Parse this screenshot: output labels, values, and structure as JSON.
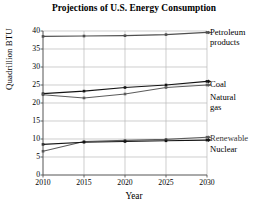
{
  "chart_data": {
    "type": "line",
    "title": "Projections of U.S. Energy Consumption",
    "xlabel": "Year",
    "ylabel": "Quadrillion BTU",
    "x": [
      2010,
      2015,
      2020,
      2025,
      2030
    ],
    "xtick_labels": [
      "2010",
      "2015",
      "2020",
      "2025",
      "2030"
    ],
    "ytick_labels": [
      "0",
      "5",
      "10",
      "15",
      "20",
      "25",
      "30",
      "35",
      "40"
    ],
    "ytick_values": [
      0,
      5,
      10,
      15,
      20,
      25,
      30,
      35,
      40
    ],
    "xlim": [
      2010,
      2030
    ],
    "ylim": [
      0,
      40
    ],
    "grid": true,
    "legend_position": "right-inline",
    "series": [
      {
        "name": "Petroleum products",
        "label_lines": [
          "Petroleum",
          "products"
        ],
        "color": "#4f4f4f",
        "values": [
          38.5,
          38.6,
          38.7,
          39.0,
          39.6
        ]
      },
      {
        "name": "Coal",
        "label_lines": [
          "Coal"
        ],
        "color": "#141414",
        "values": [
          22.6,
          23.3,
          24.3,
          25.0,
          26.0
        ]
      },
      {
        "name": "Natural gas",
        "label_lines": [
          "Natural",
          "gas"
        ],
        "color": "#5c5c5c",
        "values": [
          22.3,
          21.4,
          22.5,
          24.3,
          25.0
        ]
      },
      {
        "name": "Renewable",
        "label_lines": [
          "Renewable"
        ],
        "color": "#5c5c5c",
        "values": [
          6.6,
          9.3,
          9.6,
          9.9,
          10.5
        ]
      },
      {
        "name": "Nuclear",
        "label_lines": [
          "Nuclear"
        ],
        "color": "#141414",
        "values": [
          8.5,
          9.1,
          9.3,
          9.5,
          9.7
        ]
      }
    ]
  },
  "axis": {
    "title": "Projections of U.S. Energy Consumption",
    "xlabel": "Year",
    "ylabel": "Quadrillion BTU"
  },
  "labels": {
    "petroleum_line1": "Petroleum",
    "petroleum_line2": "products",
    "coal": "Coal",
    "natural_line1": "Natural",
    "natural_line2": "gas",
    "renewable": "Renewable",
    "nuclear": "Nuclear"
  },
  "colors": {
    "grid": "#b9b9b9",
    "axis": "#555555",
    "dark_series": "#141414",
    "gray_series": "#5c5c5c",
    "background": "#ffffff"
  }
}
